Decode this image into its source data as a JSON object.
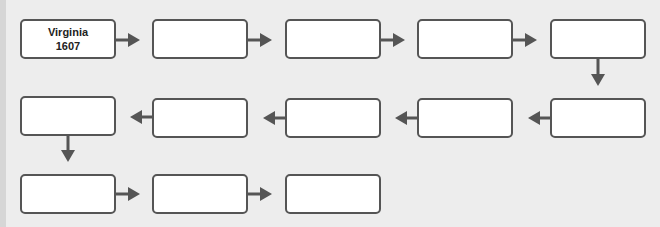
{
  "diagram": {
    "type": "flowchart-timeline",
    "colors": {
      "box_border": "#555555",
      "box_fill": "#ffffff",
      "arrow": "#555555",
      "background": "#ededed"
    },
    "boxes": [
      {
        "line1": "Virginia",
        "line2": "1607"
      },
      {
        "line1": "",
        "line2": ""
      },
      {
        "line1": "",
        "line2": ""
      },
      {
        "line1": "",
        "line2": ""
      },
      {
        "line1": "",
        "line2": ""
      },
      {
        "line1": "",
        "line2": ""
      },
      {
        "line1": "",
        "line2": ""
      },
      {
        "line1": "",
        "line2": ""
      },
      {
        "line1": "",
        "line2": ""
      },
      {
        "line1": "",
        "line2": ""
      },
      {
        "line1": "",
        "line2": ""
      },
      {
        "line1": "",
        "line2": ""
      },
      {
        "line1": "",
        "line2": ""
      }
    ]
  }
}
